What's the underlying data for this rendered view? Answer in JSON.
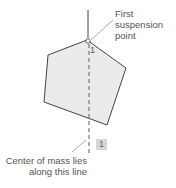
{
  "diagram": {
    "labels": {
      "suspension_line1": "First",
      "suspension_line2": "suspension",
      "suspension_line3": "point",
      "com_line1": "Center of mass lies",
      "com_line2": "along this line",
      "point_marker": "1",
      "step_badge": "1"
    },
    "colors": {
      "polygon_fill": "#ebebeb",
      "polygon_stroke": "#444444",
      "line": "#555555",
      "leader": "#888888",
      "badge_bg": "#d6d6d6"
    },
    "polygon_points": "87,40 48,55 44,102 107,125 126,68"
  }
}
